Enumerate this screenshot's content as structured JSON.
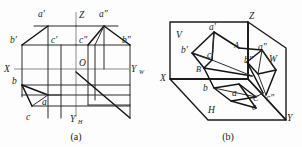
{
  "figure": {
    "background_color": "#fdfdfd",
    "line_color": "#1a1a1a",
    "axis_color": "#8a8a8a"
  },
  "panel_a": {
    "caption": "(a)",
    "description": "Unfolded projection planes with projections of points",
    "axes": [
      {
        "name": "X",
        "label": "X"
      },
      {
        "name": "Z",
        "label": "Z"
      },
      {
        "name": "O",
        "label": "O"
      },
      {
        "name": "Y_W",
        "label": "Y",
        "subscript": "W"
      },
      {
        "name": "Y_H",
        "label": "Y",
        "subscript": "H"
      }
    ],
    "point_labels": [
      {
        "name": "a-prime",
        "label": "a",
        "prime": "′"
      },
      {
        "name": "a-double-prime",
        "label": "a",
        "prime": "″"
      },
      {
        "name": "b-prime",
        "label": "b",
        "prime": "′"
      },
      {
        "name": "b-double-prime",
        "label": "b",
        "prime": "″"
      },
      {
        "name": "c-prime",
        "label": "c",
        "prime": "′"
      },
      {
        "name": "c-double-prime",
        "label": "c",
        "prime": "″"
      },
      {
        "name": "a-plain",
        "label": "a",
        "prime": ""
      },
      {
        "name": "b-plain",
        "label": "b",
        "prime": ""
      },
      {
        "name": "c-plain",
        "label": "c",
        "prime": ""
      }
    ]
  },
  "panel_b": {
    "caption": "(b)",
    "description": "Folded projection box with planes V, H, W and points A, B, C",
    "axes": [
      {
        "name": "X",
        "label": "X"
      },
      {
        "name": "Z",
        "label": "Z"
      },
      {
        "name": "Y",
        "label": "Y"
      }
    ],
    "planes": [
      {
        "name": "plane-V",
        "label": "V"
      },
      {
        "name": "plane-H",
        "label": "H"
      },
      {
        "name": "plane-W",
        "label": "W"
      }
    ],
    "space_points": [
      {
        "name": "point-A",
        "label": "A"
      },
      {
        "name": "point-B",
        "label": "B"
      },
      {
        "name": "point-C",
        "label": "C"
      }
    ],
    "point_labels": [
      {
        "name": "a-prime",
        "label": "a",
        "prime": "′"
      },
      {
        "name": "a-double-prime",
        "label": "a",
        "prime": "″"
      },
      {
        "name": "b-prime",
        "label": "b",
        "prime": "′"
      },
      {
        "name": "b-double-prime",
        "label": "b",
        "prime": "″"
      },
      {
        "name": "c-prime",
        "label": "c",
        "prime": "′"
      },
      {
        "name": "c-double-prime",
        "label": "c",
        "prime": "″"
      },
      {
        "name": "a-plain",
        "label": "a",
        "prime": ""
      },
      {
        "name": "b-plain",
        "label": "b",
        "prime": ""
      },
      {
        "name": "c-plain",
        "label": "c",
        "prime": ""
      }
    ]
  }
}
